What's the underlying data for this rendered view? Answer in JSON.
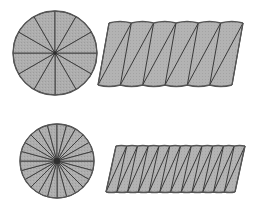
{
  "figure": {
    "background_color": "#ffffff",
    "fill_color": "#aaaaaa",
    "stroke_color": "#3a3a3a",
    "outline_color": "#555555",
    "fill_texture": "fine-stipple",
    "panel_count": 4
  },
  "panels": [
    {
      "id": "top-left-circle",
      "shape": "circle-sectors",
      "label": "",
      "sector_count": 12,
      "center_x": 55,
      "center_y": 53,
      "radius": 42,
      "start_angle_deg": 0
    },
    {
      "id": "top-right-parallelogram",
      "shape": "sector-strip-parallelogram",
      "label": "",
      "sector_count": 12,
      "left_top_x": 109,
      "right_top_x": 243,
      "top_y": 23,
      "bottom_y": 85,
      "slant_dx": -11,
      "arc_bulge": 3
    },
    {
      "id": "bottom-left-circle",
      "shape": "circle-sectors",
      "label": "",
      "sector_count": 24,
      "center_x": 57,
      "center_y": 161,
      "radius": 37,
      "start_angle_deg": 0
    },
    {
      "id": "bottom-right-parallelogram",
      "shape": "sector-strip-parallelogram",
      "label": "",
      "sector_count": 24,
      "left_top_x": 116,
      "right_top_x": 245,
      "top_y": 146,
      "bottom_y": 192,
      "slant_dx": -10,
      "arc_bulge": 1
    }
  ],
  "geometry_notes": {
    "top_sector_angle_deg": 30,
    "bottom_sector_angle_deg": 15,
    "arrangement": "alternating up-down sectors forming near-parallelogram"
  }
}
